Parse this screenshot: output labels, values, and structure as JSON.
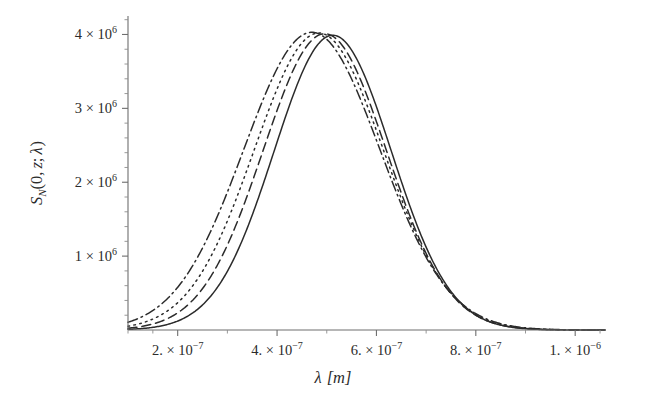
{
  "figure": {
    "name": "spectral-density-plot",
    "background": "#ffffff",
    "ink_color": "#2b2b2b",
    "axis_color": "#6e6e6e"
  },
  "axes": {
    "x": {
      "title": "λ [m]",
      "title_parts": {
        "symbol": "λ",
        "unit": "[m]"
      },
      "tick_labels": [
        {
          "mantissa": "2.",
          "times": "×",
          "base": "10",
          "exponent": "−7",
          "value": 2e-07
        },
        {
          "mantissa": "4.",
          "times": "×",
          "base": "10",
          "exponent": "−7",
          "value": 4e-07
        },
        {
          "mantissa": "6.",
          "times": "×",
          "base": "10",
          "exponent": "−7",
          "value": 6e-07
        },
        {
          "mantissa": "8.",
          "times": "×",
          "base": "10",
          "exponent": "−7",
          "value": 8e-07
        },
        {
          "mantissa": "1.",
          "times": "×",
          "base": "10",
          "exponent": "−6",
          "value": 1e-06
        }
      ],
      "range": [
        1e-07,
        1.06e-06
      ],
      "minor_ticks_between": 1
    },
    "y": {
      "title": "S_N(0, z; λ)",
      "title_parts": {
        "symbol": "S",
        "subscript": "N",
        "open": "(",
        "arg1": "0",
        "comma": ",",
        "arg2": "z",
        "semicolon": ";",
        "arg3": "λ",
        "close": ")"
      },
      "tick_labels": [
        {
          "mantissa": "1",
          "times": "×",
          "base": "10",
          "exponent": "6",
          "value": 1000000
        },
        {
          "mantissa": "2",
          "times": "×",
          "base": "10",
          "exponent": "6",
          "value": 2000000
        },
        {
          "mantissa": "3",
          "times": "×",
          "base": "10",
          "exponent": "6",
          "value": 3000000
        },
        {
          "mantissa": "4",
          "times": "×",
          "base": "10",
          "exponent": "6",
          "value": 4000000
        }
      ],
      "range": [
        0,
        4250000
      ],
      "minor_ticks_between": 4
    }
  },
  "chart_data": {
    "type": "line",
    "title": "",
    "xlabel": "λ [m]",
    "ylabel": "S_N(0, z; λ)",
    "xlim": [
      1e-07,
      1.06e-06
    ],
    "ylim": [
      0,
      4250000
    ],
    "grid": false,
    "legend": "none",
    "x_tick_values": [
      2e-07,
      4e-07,
      6e-07,
      8e-07,
      1e-06
    ],
    "y_tick_values": [
      1000000,
      2000000,
      3000000,
      4000000
    ],
    "series": [
      {
        "name": "curve-solid",
        "style": "solid",
        "peak_x": 5.12e-07,
        "peak_y": 3990000,
        "sigma": 1.18e-07,
        "x": [
          1e-07,
          1.5e-07,
          2e-07,
          2.5e-07,
          3e-07,
          3.5e-07,
          4e-07,
          4.5e-07,
          5e-07,
          5.12e-07,
          5.5e-07,
          6e-07,
          6.5e-07,
          7e-07,
          7.5e-07,
          8e-07,
          8.5e-07,
          9e-07,
          9.5e-07,
          1e-06,
          1.06e-06
        ],
        "y": [
          7000,
          33000,
          121000,
          348000,
          805000,
          1530000,
          2450000,
          3350000,
          3960000,
          3990000,
          3760000,
          2960000,
          2000000,
          1130000,
          530000,
          205000,
          66000,
          17000,
          4000,
          800,
          200
        ]
      },
      {
        "name": "curve-dashed",
        "style": "dashed",
        "peak_x": 4.96e-07,
        "peak_y": 4010000,
        "sigma": 1.24e-07,
        "x": [
          1e-07,
          1.5e-07,
          2e-07,
          2.5e-07,
          3e-07,
          3.5e-07,
          4e-07,
          4.5e-07,
          4.96e-07,
          5.5e-07,
          6e-07,
          6.5e-07,
          7e-07,
          7.5e-07,
          8e-07,
          8.5e-07,
          9e-07,
          9.5e-07,
          1e-06,
          1.06e-06
        ],
        "y": [
          16000,
          66000,
          210000,
          540000,
          1120000,
          1960000,
          2900000,
          3680000,
          4010000,
          3590000,
          2770000,
          1830000,
          1010000,
          465000,
          178000,
          56000,
          15000,
          3400,
          700,
          150
        ]
      },
      {
        "name": "curve-dotted",
        "style": "dotted",
        "peak_x": 4.84e-07,
        "peak_y": 4020000,
        "sigma": 1.3e-07,
        "x": [
          1e-07,
          1.5e-07,
          2e-07,
          2.5e-07,
          3e-07,
          3.5e-07,
          4e-07,
          4.5e-07,
          4.84e-07,
          5.5e-07,
          6e-07,
          6.5e-07,
          7e-07,
          7.5e-07,
          8e-07,
          8.5e-07,
          9e-07,
          9.5e-07,
          1e-06,
          1.06e-06
        ],
        "y": [
          30000,
          110000,
          320000,
          740000,
          1420000,
          2330000,
          3250000,
          3900000,
          4020000,
          3440000,
          2590000,
          1670000,
          900000,
          405000,
          152000,
          47000,
          12000,
          2700,
          550,
          120
        ]
      },
      {
        "name": "curve-dashdot",
        "style": "dashdot",
        "peak_x": 4.7e-07,
        "peak_y": 4030000,
        "sigma": 1.37e-07,
        "x": [
          1e-07,
          1.5e-07,
          2e-07,
          2.5e-07,
          3e-07,
          3.5e-07,
          4e-07,
          4.5e-07,
          4.7e-07,
          5.5e-07,
          6e-07,
          6.5e-07,
          7e-07,
          7.5e-07,
          8e-07,
          8.5e-07,
          9e-07,
          9.5e-07,
          1e-06,
          1.06e-06
        ],
        "y": [
          58000,
          190000,
          500000,
          1060000,
          1870000,
          2840000,
          3680000,
          4020000,
          4030000,
          3250000,
          2370000,
          1480000,
          780000,
          340000,
          124000,
          37000,
          9000,
          2000,
          400,
          90
        ]
      }
    ]
  }
}
